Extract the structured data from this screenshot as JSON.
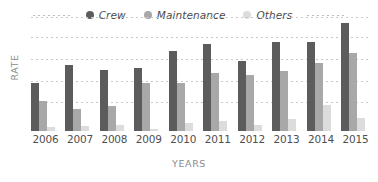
{
  "chart_data": {
    "type": "bar",
    "title": "",
    "xlabel": "YEARS",
    "ylabel": "RATE",
    "categories": [
      "2006",
      "2007",
      "2008",
      "2009",
      "2010",
      "2011",
      "2012",
      "2013",
      "2014",
      "2015"
    ],
    "series": [
      {
        "name": "Crew",
        "color": "#5c5c5c",
        "values": [
          44,
          61,
          56,
          58,
          74,
          80,
          65,
          82,
          82,
          100
        ]
      },
      {
        "name": "Maintenance",
        "color": "#a8a8a8",
        "values": [
          28,
          20,
          23,
          44,
          44,
          54,
          52,
          55,
          63,
          72
        ]
      },
      {
        "name": "Others",
        "color": "#dcdcdc",
        "values": [
          4,
          5,
          6,
          2,
          7,
          9,
          6,
          11,
          24,
          12
        ]
      }
    ],
    "ylim": [
      0,
      108
    ],
    "grid": true,
    "gridlines": [
      17,
      37,
      59,
      81,
      102
    ],
    "legend_position": "top-center",
    "legend": [
      "Crew",
      "Maintenance",
      "Others"
    ]
  },
  "legend": {
    "items": [
      {
        "label": "Crew"
      },
      {
        "label": "Maintenance"
      },
      {
        "label": "Others"
      }
    ]
  },
  "axes": {
    "y_title": "RATE",
    "x_title": "YEARS"
  }
}
